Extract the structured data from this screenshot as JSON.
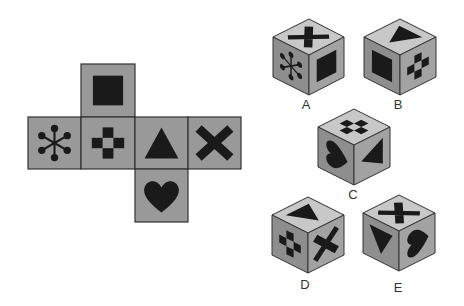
{
  "net": {
    "faces": [
      {
        "id": "top",
        "symbol": "square-icon"
      },
      {
        "id": "left",
        "symbol": "asterisk-dots-icon"
      },
      {
        "id": "center",
        "symbol": "checker-cross-icon"
      },
      {
        "id": "right",
        "symbol": "triangle-icon"
      },
      {
        "id": "far-right",
        "symbol": "x-icon"
      },
      {
        "id": "bottom",
        "symbol": "heart-icon"
      }
    ],
    "face_color": "#999999",
    "border_color": "#333333"
  },
  "options": [
    {
      "label": "A",
      "top": "x-icon",
      "left": "asterisk-dots-icon",
      "right": "square-icon"
    },
    {
      "label": "B",
      "top": "triangle-icon",
      "left": "square-icon",
      "right": "checker-cross-icon"
    },
    {
      "label": "C",
      "top": "checker-cross-icon",
      "left": "heart-icon",
      "right": "triangle-icon"
    },
    {
      "label": "D",
      "top": "triangle-icon",
      "left": "checker-cross-icon",
      "right": "x-icon"
    },
    {
      "label": "E",
      "top": "x-icon",
      "left": "triangle-icon",
      "right": "heart-icon"
    }
  ],
  "colors": {
    "cube_top": "#c8c8c8",
    "cube_left": "#8e8e8e",
    "cube_right": "#a2a2a2",
    "symbol": "#1a1a1a"
  }
}
